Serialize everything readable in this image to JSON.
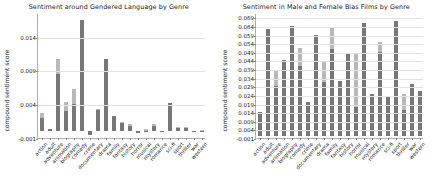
{
  "figure": {
    "background": "#ffffff",
    "bar_color_light": "#b9b9b9",
    "bar_color_dark": "#777777"
  },
  "chart_data": [
    {
      "type": "bar",
      "title": "Sentiment around Gendered Language by Genre",
      "xlabel": "",
      "ylabel": "compound sentiment score",
      "ylim": [
        -0.001,
        0.0175
      ],
      "yticks": [
        -0.001,
        0.004,
        0.009,
        0.014
      ],
      "ytick_labels": [
        "-0.001",
        "0.004",
        "0.009",
        "0.014"
      ],
      "grid": true,
      "legend": "none",
      "stacked": true,
      "categories": [
        "action",
        "adult",
        "adventure",
        "animation",
        "biography",
        "comedy",
        "crime",
        "documentary",
        "drama",
        "family",
        "fantasy",
        "history",
        "horror",
        "musical",
        "mystery",
        "romance",
        "sci-fi",
        "sport",
        "thriller",
        "war",
        "western"
      ],
      "series": [
        {
          "name": "lower segment",
          "color": "#777777",
          "values": [
            0.0019,
            0.0003,
            0.0085,
            0.003,
            0.0041,
            0.0165,
            -0.0005,
            0.0031,
            0.0107,
            0.0022,
            0.0012,
            0.0008,
            -0.0003,
            0.0,
            0.0008,
            0.0,
            0.0042,
            0.0005,
            0.0005,
            0.0,
            0.0
          ]
        },
        {
          "name": "upper segment",
          "color": "#b9b9b9",
          "values": [
            0.0027,
            0.0003,
            0.0107,
            0.0044,
            0.0063,
            0.0165,
            -0.0005,
            0.0033,
            0.0107,
            0.0022,
            0.0014,
            0.0011,
            -0.0003,
            0.0003,
            0.0011,
            0.0,
            0.0042,
            0.0006,
            0.0006,
            0.0,
            0.0002
          ]
        }
      ]
    },
    {
      "type": "bar",
      "title": "Sentiment in Male and Female Bias Films by Genre",
      "xlabel": "",
      "ylabel": "compound sentiment score",
      "ylim": [
        -0.001,
        0.0715
      ],
      "yticks": [
        -0.001,
        0.004,
        0.009,
        0.014,
        0.019,
        0.024,
        0.029,
        0.034,
        0.039,
        0.044,
        0.049,
        0.054,
        0.059,
        0.064,
        0.069
      ],
      "ytick_labels": [
        "-0.001",
        "0.004",
        "0.009",
        "0.014",
        "0.019",
        "0.024",
        "0.029",
        "0.034",
        "0.039",
        "0.044",
        "0.049",
        "0.054",
        "0.059",
        "0.064",
        "0.069"
      ],
      "grid": true,
      "legend": "none",
      "stacked": true,
      "categories": [
        "action",
        "adult",
        "adventure",
        "animation",
        "biography",
        "comedy",
        "crime",
        "documentary",
        "drama",
        "family",
        "fantasy",
        "history",
        "horror",
        "musical",
        "mystery",
        "romance",
        "sci-fi",
        "sport",
        "thriller",
        "war",
        "western"
      ],
      "series": [
        {
          "name": "lower segment",
          "color": "#777777",
          "values": [
            0.014,
            0.0625,
            0.029,
            0.044,
            0.064,
            0.0405,
            0.02,
            0.0585,
            0.0315,
            0.0505,
            0.032,
            0.048,
            0.017,
            0.0655,
            0.0245,
            0.049,
            0.0225,
            0.067,
            0.0155,
            0.0305,
            0.026
          ]
        },
        {
          "name": "upper segment",
          "color": "#b9b9b9",
          "values": [
            0.014,
            0.0625,
            0.038,
            0.044,
            0.064,
            0.051,
            0.02,
            0.0585,
            0.043,
            0.063,
            0.032,
            0.048,
            0.048,
            0.0655,
            0.0245,
            0.0545,
            0.0225,
            0.067,
            0.0245,
            0.0305,
            0.026
          ]
        }
      ]
    }
  ]
}
